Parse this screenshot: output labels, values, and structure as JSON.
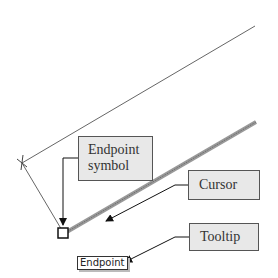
{
  "callouts": {
    "endpoint_symbol": {
      "line1": "Endpoint",
      "line2": "symbol"
    },
    "cursor": "Cursor",
    "tooltip": "Tooltip"
  },
  "tooltip_text": "Endpoint",
  "colors": {
    "callout_bg": "#e8e8e8",
    "line": "#555555",
    "thick_line": "#888888"
  }
}
